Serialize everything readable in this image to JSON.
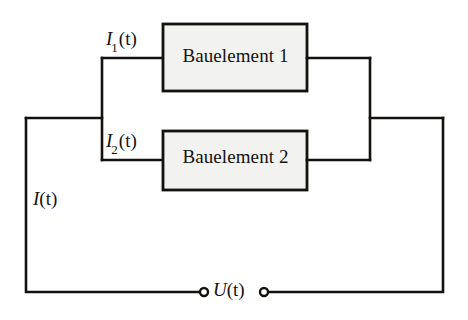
{
  "diagram": {
    "background_color": "#ffffff",
    "line_color": "#14120f",
    "box_fill_color": "#f2f2f0",
    "components": [
      {
        "id": "bauelement-1",
        "label": "Bauelement 1"
      },
      {
        "id": "bauelement-2",
        "label": "Bauelement 2"
      }
    ],
    "labels": {
      "current_branch_1": {
        "symbol": "I",
        "subscript": "1",
        "argument": "(t)",
        "text": "I1(t)"
      },
      "current_branch_2": {
        "symbol": "I",
        "subscript": "2",
        "argument": "(t)",
        "text": "I2(t)"
      },
      "current_total": {
        "symbol": "I",
        "subscript": "",
        "argument": "(t)",
        "text": "I(t)"
      },
      "voltage": {
        "symbol": "U",
        "subscript": "",
        "argument": "(t)",
        "text": "U(t)"
      }
    },
    "terminals": {
      "count": 2,
      "name": "voltage-terminal"
    }
  }
}
